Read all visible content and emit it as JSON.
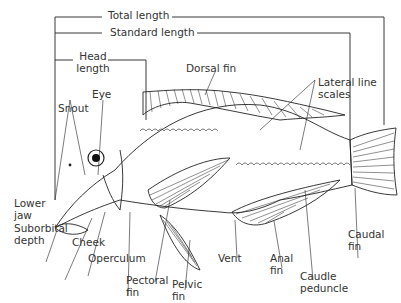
{
  "diagram": {
    "measurements": {
      "total_length": "Total length",
      "standard_length": "Standard length",
      "head_length": "Head length"
    },
    "labels": {
      "dorsal_fin": "Dorsal fin",
      "lateral_line_scales": "Lateral line scales",
      "snout": "Snout",
      "eye": "Eye",
      "lower_jaw": "Lower jaw",
      "suborbital_depth": "Suborbital depth",
      "cheek": "Cheek",
      "operculum": "Operculum",
      "pectoral_fin": "Pectoral fin",
      "pelvic_fin": "Pelvic fin",
      "vent": "Vent",
      "anal_fin": "Anal fin",
      "caudle_peduncle": "Caudle peduncle",
      "caudal_fin": "Caudal fin"
    },
    "line_color": "#222222",
    "text_color": "#333333"
  }
}
